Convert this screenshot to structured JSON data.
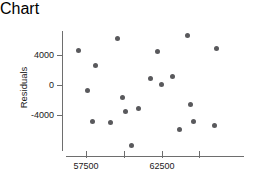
{
  "chart_data": {
    "type": "scatter",
    "title": "",
    "xlabel": "Predicted",
    "ylabel": "Residuals",
    "xticks": [
      57500,
      60000,
      62500,
      65000
    ],
    "xtick_labels": [
      "57500",
      "",
      "62500",
      ""
    ],
    "yticks": [
      4000,
      0,
      -4000
    ],
    "ytick_labels": [
      "4000",
      "0",
      "-4000"
    ],
    "xlim": [
      56000,
      68000
    ],
    "ylim": [
      -8500,
      8000
    ],
    "grid": false,
    "legend": null,
    "marker_color": "#59595c",
    "axis_color": "#6e6e6e",
    "points": [
      {
        "x": 57000,
        "y": 4700
      },
      {
        "x": 58100,
        "y": 2650
      },
      {
        "x": 57600,
        "y": -600
      },
      {
        "x": 57900,
        "y": -4800
      },
      {
        "x": 59100,
        "y": -4950
      },
      {
        "x": 59600,
        "y": 6250
      },
      {
        "x": 59900,
        "y": -1650
      },
      {
        "x": 60100,
        "y": -3500
      },
      {
        "x": 61750,
        "y": 900
      },
      {
        "x": 62250,
        "y": 4550
      },
      {
        "x": 62500,
        "y": 80
      },
      {
        "x": 63250,
        "y": 1150
      },
      {
        "x": 63700,
        "y": -5900
      },
      {
        "x": 64200,
        "y": 6700
      },
      {
        "x": 64400,
        "y": -2500
      },
      {
        "x": 64650,
        "y": -4850
      },
      {
        "x": 66150,
        "y": 4950
      },
      {
        "x": 66000,
        "y": -5300
      },
      {
        "x": 61000,
        "y": -3100
      },
      {
        "x": 60500,
        "y": -8000
      }
    ]
  },
  "axes": {
    "x_axis_name": "x-axis",
    "y_axis_name": "y-axis"
  }
}
